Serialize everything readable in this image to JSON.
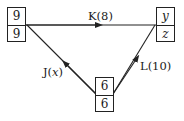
{
  "diagram": {
    "type": "activity-network",
    "nodes": [
      {
        "id": "left",
        "top_value": "9",
        "bottom_value": "9"
      },
      {
        "id": "right",
        "top_value": "y",
        "bottom_value": "z"
      },
      {
        "id": "bottom",
        "top_value": "6",
        "bottom_value": "6"
      }
    ],
    "edges": [
      {
        "id": "K",
        "from": "left",
        "to": "right",
        "name": "K",
        "duration": "8",
        "label": "K(8)"
      },
      {
        "id": "J",
        "from": "bottom",
        "to": "left",
        "name": "J",
        "duration": "x",
        "label_prefix": "J(",
        "label_var": "x",
        "label_suffix": ")"
      },
      {
        "id": "L",
        "from": "bottom",
        "to": "right",
        "name": "L",
        "duration": "10",
        "label": "L(10)"
      }
    ]
  },
  "colors": {
    "line": "#222222",
    "background": "#ffffff"
  }
}
